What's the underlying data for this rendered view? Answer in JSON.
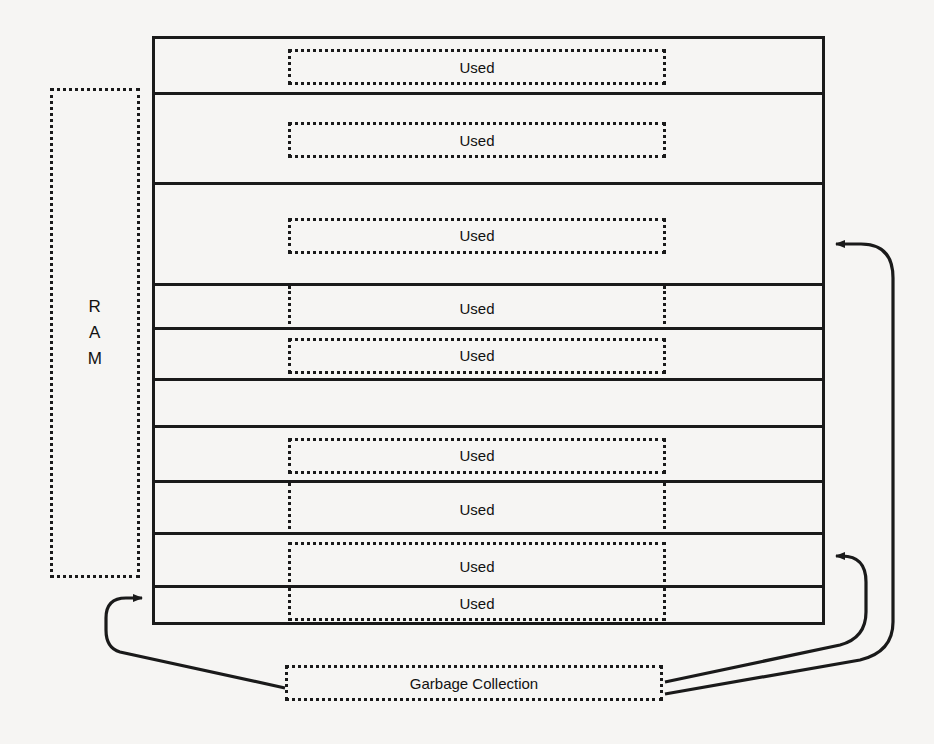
{
  "diagram": {
    "background_color": "#f6f5f3",
    "line_color": "#1a1a1a"
  },
  "ram": {
    "label": "R\nA\nM",
    "label_flat": "RAM",
    "style": "dotted"
  },
  "memory": {
    "row_count": 10,
    "rows": [
      {
        "index": 1,
        "block_label": "Used",
        "block_style": "all-sides"
      },
      {
        "index": 2,
        "block_label": "Used",
        "block_style": "all-sides"
      },
      {
        "index": 3,
        "block_label": "Used",
        "block_style": "all-sides"
      },
      {
        "index": 4,
        "block_label": "Used",
        "block_style": "sides-only"
      },
      {
        "index": 5,
        "block_label": "Used",
        "block_style": "all-sides"
      },
      {
        "index": 6,
        "block_label": "",
        "block_style": "none"
      },
      {
        "index": 7,
        "block_label": "Used",
        "block_style": "all-sides"
      },
      {
        "index": 8,
        "block_label": "Used",
        "block_style": "sides-only"
      },
      {
        "index": 9,
        "block_label": "Used",
        "block_style": "open-bottom"
      },
      {
        "index": 10,
        "block_label": "Used",
        "block_style": "open-top"
      }
    ]
  },
  "garbage_collection": {
    "label": "Garbage Collection",
    "style": "dotted"
  },
  "arrows": [
    {
      "name": "gc-to-memory-top",
      "from": "garbage-collection-right",
      "to": "memory-right-upper",
      "direction": "left"
    },
    {
      "name": "gc-to-memory-lower",
      "from": "garbage-collection-right",
      "to": "memory-right-lower",
      "direction": "left"
    },
    {
      "name": "gc-to-memory-bottom",
      "from": "garbage-collection-left",
      "to": "memory-left-bottom",
      "direction": "right"
    }
  ]
}
